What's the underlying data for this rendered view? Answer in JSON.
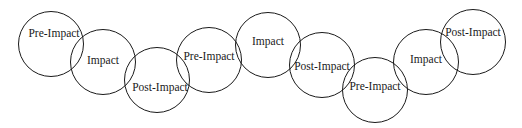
{
  "diagram": {
    "type": "overlapping-circle-sequence",
    "stroke_color": "#1a1a1a",
    "background": "#ffffff",
    "nodes": [
      {
        "label": "Pre-Impact",
        "cx": 51,
        "cy": 44,
        "r": 33,
        "lx": 54,
        "ly": 34
      },
      {
        "label": "Impact",
        "cx": 103,
        "cy": 62,
        "r": 33,
        "lx": 103,
        "ly": 61
      },
      {
        "label": "Post-Impact",
        "cx": 157,
        "cy": 80,
        "r": 33,
        "lx": 160,
        "ly": 88
      },
      {
        "label": "Pre-Impact",
        "cx": 209,
        "cy": 60,
        "r": 33,
        "lx": 209,
        "ly": 57
      },
      {
        "label": "Impact",
        "cx": 268,
        "cy": 45,
        "r": 33,
        "lx": 268,
        "ly": 42
      },
      {
        "label": "Post-Impact",
        "cx": 322,
        "cy": 65,
        "r": 33,
        "lx": 322,
        "ly": 67
      },
      {
        "label": "Pre-Impact",
        "cx": 375,
        "cy": 90,
        "r": 33,
        "lx": 375,
        "ly": 87
      },
      {
        "label": "Impact",
        "cx": 426,
        "cy": 62,
        "r": 33,
        "lx": 426,
        "ly": 60
      },
      {
        "label": "Post-Impact",
        "cx": 473,
        "cy": 42,
        "r": 33,
        "lx": 473,
        "ly": 33
      }
    ]
  }
}
